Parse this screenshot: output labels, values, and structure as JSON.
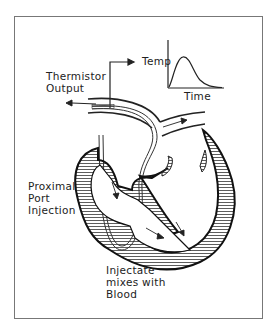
{
  "figure": {
    "labels": {
      "thermistor_output": [
        "Thermistor",
        "Output"
      ],
      "proximal_port": [
        "Proximal",
        "Port",
        "Injection"
      ],
      "injectate": [
        "Injectate",
        "mixes with",
        "Blood"
      ]
    },
    "curve": {
      "ylabel": "Temp",
      "xlabel": "Time"
    },
    "colors": {
      "line": "#222222",
      "frame": "#777777",
      "background": "#ffffff"
    }
  }
}
